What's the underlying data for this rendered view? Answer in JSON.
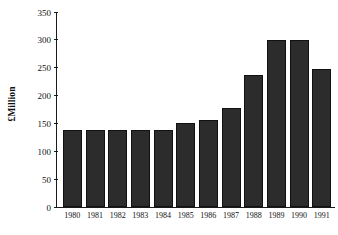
{
  "chart_data": {
    "type": "bar",
    "title": "",
    "xlabel": "",
    "ylabel": "£Million",
    "categories": [
      "1980",
      "1981",
      "1982",
      "1983",
      "1984",
      "1985",
      "1986",
      "1987",
      "1988",
      "1989",
      "1990",
      "1991"
    ],
    "values": [
      138,
      138,
      139,
      139,
      139,
      150,
      157,
      178,
      237,
      299,
      299,
      247
    ],
    "ylim": [
      0,
      350
    ],
    "ytick_labels": [
      "0",
      "50",
      "100",
      "150",
      "200",
      "250",
      "300",
      "350"
    ],
    "ytick_values": [
      0,
      50,
      100,
      150,
      200,
      250,
      300,
      350
    ],
    "grid": false,
    "legend": "none",
    "bar_color": "#2c2c2c",
    "axis_color": "#1a1a1a",
    "background_color": "#ffffff"
  }
}
